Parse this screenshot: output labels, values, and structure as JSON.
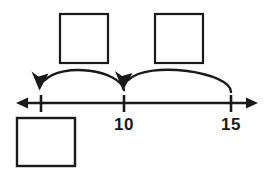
{
  "figure": {
    "type": "number-line-with-jumps",
    "background_color": "#ffffff",
    "stroke_color": "#1a1a1a"
  },
  "number_line": {
    "axis": {
      "y": 103,
      "x_start": 16,
      "x_end": 258,
      "left_arrow": "arrow-left",
      "right_arrow": "arrow-right"
    },
    "ticks": [
      {
        "id": "tick-unlabeled",
        "x": 41,
        "label": ""
      },
      {
        "id": "tick-10",
        "x": 124,
        "label": "10"
      },
      {
        "id": "tick-15",
        "x": 231,
        "label": "15"
      }
    ]
  },
  "jump_arcs": [
    {
      "id": "arc-left",
      "from_x": 124,
      "to_x": 41,
      "direction": "leftward",
      "arrowhead": "down-left",
      "apex_y": 68
    },
    {
      "id": "arc-right",
      "from_x": 231,
      "to_x": 124,
      "direction": "leftward",
      "arrowhead": "down-left",
      "apex_y": 68
    }
  ],
  "answer_boxes": [
    {
      "id": "box-top-left",
      "x": 60,
      "y": 14,
      "width": 48,
      "height": 49,
      "value": ""
    },
    {
      "id": "box-top-right",
      "x": 155,
      "y": 14,
      "width": 48,
      "height": 49,
      "value": ""
    },
    {
      "id": "box-bottom-left",
      "x": 17,
      "y": 118,
      "width": 58,
      "height": 48,
      "value": ""
    }
  ]
}
